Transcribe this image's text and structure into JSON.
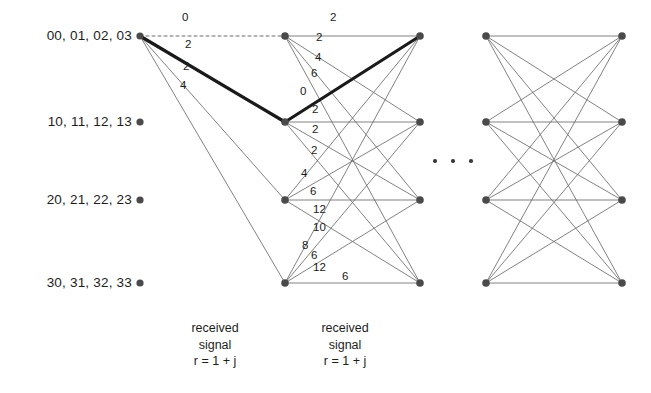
{
  "figure": {
    "type": "trellis-diagram",
    "title": "",
    "background": "#ffffff",
    "stroke_color": "#6b6b6b",
    "node_color": "#4a4a4a",
    "survivor_color": "#1a1a1a",
    "width": 651,
    "height": 393
  },
  "state_labels": [
    {
      "text": "00, 01, 02, 03",
      "x": 132,
      "y": 36
    },
    {
      "text": "10, 11, 12, 13",
      "x": 132,
      "y": 122
    },
    {
      "text": "20, 21, 22, 23",
      "x": 132,
      "y": 200
    },
    {
      "text": "30, 31, 32, 33",
      "x": 132,
      "y": 283
    }
  ],
  "columns": [
    {
      "name": "column-0",
      "x": 140
    },
    {
      "name": "column-1",
      "x": 285
    },
    {
      "name": "column-2",
      "x": 420
    },
    {
      "name": "column-3",
      "x": 486
    },
    {
      "name": "column-4",
      "x": 622
    }
  ],
  "rows": [
    36,
    122,
    200,
    283
  ],
  "stage1_metrics": [
    {
      "value": "0",
      "x": 182,
      "y": 18
    },
    {
      "value": "2",
      "x": 185,
      "y": 45
    },
    {
      "value": "2",
      "x": 183,
      "y": 67
    },
    {
      "value": "4",
      "x": 180,
      "y": 86
    }
  ],
  "stage2_metrics": [
    {
      "value": "2",
      "x": 330,
      "y": 18
    },
    {
      "value": "2",
      "x": 316,
      "y": 38
    },
    {
      "value": "4",
      "x": 315,
      "y": 58
    },
    {
      "value": "6",
      "x": 311,
      "y": 74
    },
    {
      "value": "0",
      "x": 300,
      "y": 92
    },
    {
      "value": "2",
      "x": 312,
      "y": 110
    },
    {
      "value": "2",
      "x": 312,
      "y": 130
    },
    {
      "value": "2",
      "x": 311,
      "y": 151
    },
    {
      "value": "4",
      "x": 301,
      "y": 174
    },
    {
      "value": "6",
      "x": 310,
      "y": 192
    },
    {
      "value": "12",
      "x": 313,
      "y": 210
    },
    {
      "value": "10",
      "x": 313,
      "y": 228
    },
    {
      "value": "8",
      "x": 302,
      "y": 246
    },
    {
      "value": "6",
      "x": 311,
      "y": 256
    },
    {
      "value": "12",
      "x": 313,
      "y": 268
    },
    {
      "value": "6",
      "x": 342,
      "y": 277
    }
  ],
  "survivor_path": {
    "label": "surviving-path",
    "nodes": [
      [
        140,
        36
      ],
      [
        285,
        122
      ],
      [
        420,
        36
      ]
    ],
    "branch_metrics": [
      "2",
      "0"
    ]
  },
  "dashed_edge": {
    "from": [
      140,
      36
    ],
    "to": [
      285,
      36
    ],
    "metric": "0"
  },
  "ellipsis": {
    "label": "continuation-ellipsis",
    "dots": [
      {
        "x": 433,
        "y": 159
      },
      {
        "x": 451,
        "y": 159
      },
      {
        "x": 469,
        "y": 159
      }
    ]
  },
  "captions": [
    {
      "lines": [
        "received",
        "signal",
        "r = 1 + j"
      ],
      "cx": 215,
      "y": 320
    },
    {
      "lines": [
        "received",
        "signal",
        "r = 1 + j"
      ],
      "cx": 345,
      "y": 320
    }
  ]
}
